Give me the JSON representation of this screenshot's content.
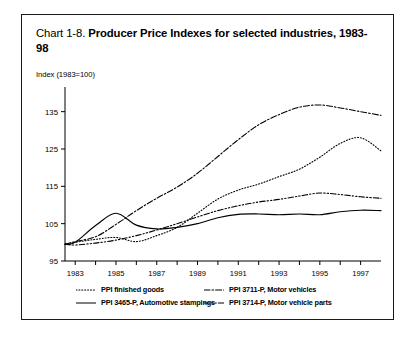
{
  "title": {
    "prefix": "Chart 1-8. ",
    "main": "Producer Price Indexes for selected industries, 1983-98"
  },
  "axis_caption": "Index (1983=100)",
  "legend": {
    "rows": [
      [
        {
          "label": "PPI finished goods",
          "style": "dotted",
          "series": "finished_goods"
        },
        {
          "label": "PPI 3711-P, Motor vehicles",
          "style": "dash-dot",
          "series": "motor_vehicles"
        }
      ],
      [
        {
          "label": "PPI 3465-P, Automotive stampings",
          "style": "solid",
          "series": "automotive_stampings"
        },
        {
          "label": "PPI 3714-P, Motor vehicle parts",
          "style": "dash-dot-dot",
          "series": "motor_vehicle_parts"
        }
      ]
    ]
  },
  "chart_data": {
    "type": "line",
    "title": "Chart 1-8. Producer Price Indexes for selected industries, 1983-98",
    "ylabel": "Index (1983=100)",
    "xlabel": "",
    "ylim": [
      95,
      140
    ],
    "xlim": [
      1982.5,
      1998.0
    ],
    "yticks": [
      95,
      105,
      115,
      125,
      135
    ],
    "xticks": [
      1983,
      1984,
      1985,
      1986,
      1987,
      1988,
      1989,
      1990,
      1991,
      1992,
      1993,
      1994,
      1995,
      1996,
      1997
    ],
    "xtick_labels": [
      "1983",
      "",
      "1985",
      "",
      "1987",
      "",
      "1989",
      "",
      "1991",
      "",
      "1993",
      "",
      "1995",
      "",
      "1997"
    ],
    "grid": false,
    "legend_position": "below",
    "x": [
      1982.5,
      1983,
      1984,
      1985,
      1986,
      1987,
      1988,
      1989,
      1990,
      1991,
      1992,
      1993,
      1994,
      1995,
      1996,
      1997,
      1998
    ],
    "series": [
      {
        "name": "PPI finished goods",
        "style": "dotted",
        "values": [
          99.5,
          100.0,
          100.8,
          101.3,
          100.2,
          101.8,
          104.0,
          107.8,
          111.6,
          114.0,
          115.6,
          117.6,
          119.6,
          122.8,
          126.5,
          128.0,
          124.5
        ]
      },
      {
        "name": "PPI 3465-P, Automotive stampings",
        "style": "solid",
        "values": [
          99.5,
          100.0,
          104.5,
          107.8,
          104.6,
          103.6,
          104.0,
          105.0,
          106.6,
          107.5,
          107.6,
          107.4,
          107.6,
          107.4,
          108.2,
          108.6,
          108.5
        ]
      },
      {
        "name": "PPI 3711-P, Motor vehicles",
        "style": "dash-dot",
        "values": [
          99.5,
          100.2,
          101.5,
          104.8,
          108.5,
          111.8,
          114.8,
          118.5,
          123.0,
          127.5,
          131.5,
          134.2,
          136.2,
          136.8,
          136.0,
          135.0,
          134.0
        ]
      },
      {
        "name": "PPI 3714-P, Motor vehicle parts",
        "style": "dash-dot-dot",
        "values": [
          99.5,
          99.3,
          99.8,
          100.6,
          101.8,
          103.3,
          105.0,
          106.8,
          108.5,
          109.8,
          110.8,
          111.5,
          112.4,
          113.2,
          112.8,
          112.2,
          111.8
        ]
      }
    ]
  }
}
